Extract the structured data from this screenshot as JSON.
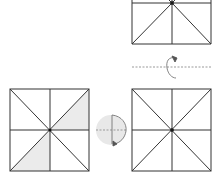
{
  "diagram": {
    "colors": {
      "line": "#333333",
      "shade": "#e8e8e8",
      "dashed": "#888888",
      "arrow": "#666666",
      "circle": "#e6e6e6"
    },
    "steps": [
      {
        "id": "top-square",
        "label": "",
        "partial": true
      },
      {
        "id": "flip-indicator",
        "icon": "flip-over-arrow-icon"
      },
      {
        "id": "right-square",
        "label": ""
      },
      {
        "id": "rotate-indicator",
        "icon": "rotate-arrow-icon"
      },
      {
        "id": "left-square",
        "label": "",
        "shaded_triangles": 2
      }
    ]
  }
}
